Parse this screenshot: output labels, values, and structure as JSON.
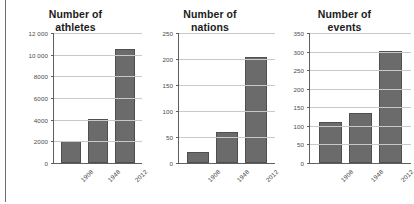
{
  "figure": {
    "panels": [
      {
        "id": "athletes",
        "title_line1": "Number of",
        "title_line2": "athletes"
      },
      {
        "id": "nations",
        "title_line1": "Number of",
        "title_line2": "nations"
      },
      {
        "id": "events",
        "title_line1": "Number of",
        "title_line2": "events"
      }
    ]
  },
  "style": {
    "bar_fill": "#6b6b6b",
    "bar_stroke": "#4f4f4f",
    "gridline_color": "#c9c9c9",
    "axis_color": "#5f5f5f",
    "title_color": "#1b1b1b"
  },
  "chart_data": [
    {
      "type": "bar",
      "title": "Number of athletes",
      "xlabel": "",
      "ylabel": "",
      "categories": [
        "1908",
        "1948",
        "2012"
      ],
      "values": [
        2008,
        4104,
        10500
      ],
      "ylim": [
        0,
        12000
      ],
      "yticks": [
        0,
        2000,
        4000,
        6000,
        8000,
        10000,
        12000
      ],
      "ytick_labels": [
        "0",
        "2000",
        "4000",
        "6000",
        "8000",
        "10 000",
        "12 000"
      ],
      "grid": true,
      "legend": "none"
    },
    {
      "type": "bar",
      "title": "Number of nations",
      "xlabel": "",
      "ylabel": "",
      "categories": [
        "1908",
        "1948",
        "2012"
      ],
      "values": [
        22,
        59,
        204
      ],
      "ylim": [
        0,
        250
      ],
      "yticks": [
        0,
        50,
        100,
        150,
        200,
        250
      ],
      "ytick_labels": [
        "0",
        "50",
        "100",
        "150",
        "200",
        "250"
      ],
      "grid": true,
      "legend": "none"
    },
    {
      "type": "bar",
      "title": "Number of events",
      "xlabel": "",
      "ylabel": "",
      "categories": [
        "1908",
        "1948",
        "2012"
      ],
      "values": [
        110,
        136,
        302
      ],
      "ylim": [
        0,
        350
      ],
      "yticks": [
        0,
        50,
        100,
        150,
        200,
        250,
        300,
        350
      ],
      "ytick_labels": [
        "0",
        "50",
        "100",
        "150",
        "200",
        "250",
        "300",
        "350"
      ],
      "grid": true,
      "legend": "none"
    }
  ]
}
